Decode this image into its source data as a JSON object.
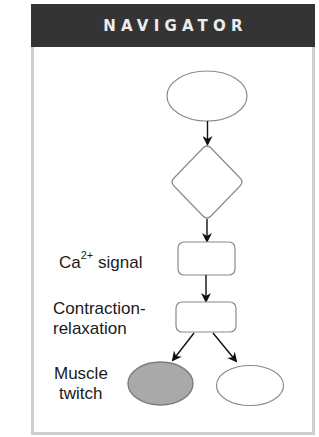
{
  "header": {
    "title": "NAVIGATOR"
  },
  "diagram": {
    "nodes": [
      {
        "id": "top-ellipse",
        "shape": "ellipse",
        "label": "",
        "fill": "#ffffff"
      },
      {
        "id": "decision-diamond",
        "shape": "diamond",
        "label": "",
        "fill": "#ffffff"
      },
      {
        "id": "ca-signal-box",
        "shape": "rounded-rect",
        "label": "",
        "fill": "#ffffff"
      },
      {
        "id": "contraction-box",
        "shape": "rounded-rect",
        "label": "",
        "fill": "#ffffff"
      },
      {
        "id": "muscle-twitch-ellipse",
        "shape": "ellipse",
        "label": "",
        "fill": "#a9a9a9"
      },
      {
        "id": "right-ellipse",
        "shape": "ellipse",
        "label": "",
        "fill": "#ffffff"
      }
    ],
    "edges": [
      {
        "from": "top-ellipse",
        "to": "decision-diamond"
      },
      {
        "from": "decision-diamond",
        "to": "ca-signal-box"
      },
      {
        "from": "ca-signal-box",
        "to": "contraction-box"
      },
      {
        "from": "contraction-box",
        "to": "muscle-twitch-ellipse"
      },
      {
        "from": "contraction-box",
        "to": "right-ellipse"
      }
    ],
    "labels": {
      "ca_base": "Ca",
      "ca_sup": "2+",
      "ca_rest": " signal",
      "contraction_line1": "Contraction-",
      "contraction_line2": "relaxation",
      "muscle_line1": "Muscle",
      "muscle_line2": "twitch"
    }
  },
  "colors": {
    "header_bg": "#343434",
    "header_text": "#ececec",
    "border": "#cfcfcf",
    "stroke": "#8a8a8a",
    "highlight_fill": "#a9a9a9",
    "arrow": "#111111"
  }
}
